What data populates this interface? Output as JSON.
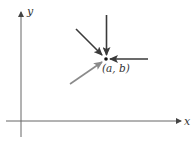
{
  "diagram": {
    "axes": {
      "x_label": "x",
      "y_label": "y"
    },
    "point": {
      "label": "(a, b)"
    },
    "arrows": [
      {
        "name": "from-above",
        "color": "#3a3a3a"
      },
      {
        "name": "from-upper-left",
        "color": "#3a3a3a"
      },
      {
        "name": "from-right",
        "color": "#3a3a3a"
      },
      {
        "name": "from-lower-left",
        "color": "#8a8a8a"
      }
    ],
    "colors": {
      "axis": "#555555",
      "point": "#111111"
    }
  }
}
